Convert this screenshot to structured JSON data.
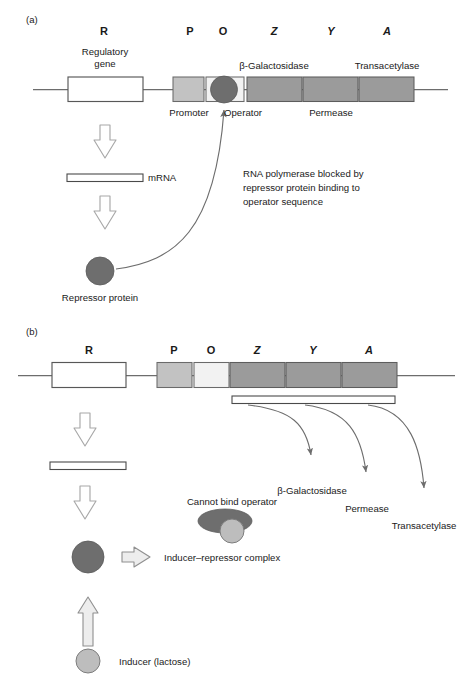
{
  "figure": {
    "title_semantic": "lac-operon-regulation-diagram",
    "panels": [
      {
        "tag": "(a)",
        "state": "repressed",
        "gene_letters": [
          "R",
          "P",
          "O",
          "Z",
          "Y",
          "A"
        ],
        "labels": {
          "regulatory_gene_line1": "Regulatory",
          "regulatory_gene_line2": "gene",
          "promoter": "Promoter",
          "operator": "Operator",
          "beta_galactosidase": "β-Galactosidase",
          "permease": "Permease",
          "transacetylase": "Transacetylase",
          "mrna": "mRNA",
          "repressor_protein": "Repressor protein",
          "note_line1": "RNA polymerase blocked by",
          "note_line2": "repressor protein binding to",
          "note_line3": "operator sequence"
        }
      },
      {
        "tag": "(b)",
        "state": "induced",
        "gene_letters": [
          "R",
          "P",
          "O",
          "Z",
          "Y",
          "A"
        ],
        "labels": {
          "beta_galactosidase": "β-Galactosidase",
          "permease": "Permease",
          "transacetylase": "Transacetylase",
          "cannot_bind_operator": "Cannot bind operator",
          "inducer_repressor_complex": "Inducer–repressor complex",
          "inducer_lactose": "Inducer (lactose)"
        }
      }
    ],
    "colors": {
      "background": "#ffffff",
      "ink": "#1a1a1a",
      "dna_line": "#6d6d6d",
      "box_outline": "#585858",
      "gene_white": "#ffffff",
      "promoter_gray": "#c0c0c0",
      "operator_light": "#ededed",
      "structural_gray": "#9b9b9b",
      "repressor_dark": "#6e6e6e",
      "inducer_light": "#bdbdbd",
      "hollow_arrow_stroke": "#9a9a9a",
      "curve_stroke": "#6d6d6d"
    }
  }
}
